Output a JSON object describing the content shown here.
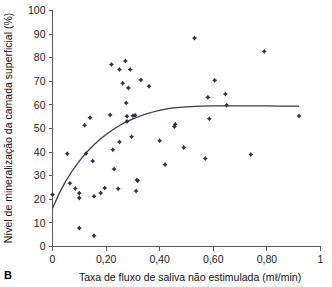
{
  "panel": {
    "label": "B"
  },
  "chart_data": {
    "type": "scatter",
    "title": "",
    "xlabel": "Taxa de fluxo de saliva não estimulada (mℓ/min)",
    "ylabel": "Nível de mineralização da camada superficial (%)",
    "xlim": [
      0,
      1
    ],
    "ylim": [
      0,
      100
    ],
    "grid": false,
    "legend": "none",
    "marker_color": "#2e2e5c",
    "curve_color": "#3c3c3c",
    "axis_color": "#5a5a5a",
    "xticks": [
      0,
      0.2,
      0.4,
      0.6,
      0.8,
      1
    ],
    "xtick_labels": [
      "0",
      "0,20",
      "0,40",
      "0,60",
      "0,80",
      "1"
    ],
    "yticks": [
      0,
      10,
      20,
      30,
      40,
      50,
      60,
      70,
      80,
      90,
      100
    ],
    "ytick_labels": [
      "0",
      "10",
      "20",
      "30",
      "40",
      "50",
      "60",
      "70",
      "80",
      "90",
      "100"
    ],
    "series": [
      {
        "name": "Amostras",
        "type": "scatter",
        "points": [
          [
            0.0,
            22.0
          ],
          [
            0.055,
            39.3
          ],
          [
            0.065,
            26.8
          ],
          [
            0.085,
            24.6
          ],
          [
            0.1,
            22.6
          ],
          [
            0.1,
            20.6
          ],
          [
            0.1,
            7.8
          ],
          [
            0.125,
            39.4
          ],
          [
            0.12,
            51.4
          ],
          [
            0.14,
            54.6
          ],
          [
            0.15,
            36.2
          ],
          [
            0.155,
            21.3
          ],
          [
            0.155,
            4.6
          ],
          [
            0.18,
            22.7
          ],
          [
            0.195,
            24.8
          ],
          [
            0.215,
            55.7
          ],
          [
            0.22,
            77.1
          ],
          [
            0.225,
            41.0
          ],
          [
            0.23,
            32.8
          ],
          [
            0.245,
            24.5
          ],
          [
            0.25,
            75.0
          ],
          [
            0.25,
            44.3
          ],
          [
            0.262,
            69.2
          ],
          [
            0.272,
            78.6
          ],
          [
            0.275,
            60.8
          ],
          [
            0.278,
            55.2
          ],
          [
            0.278,
            53.0
          ],
          [
            0.283,
            67.2
          ],
          [
            0.29,
            75.0
          ],
          [
            0.295,
            46.5
          ],
          [
            0.3,
            55.4
          ],
          [
            0.308,
            55.6
          ],
          [
            0.312,
            23.5
          ],
          [
            0.315,
            28.2
          ],
          [
            0.318,
            27.9
          ],
          [
            0.33,
            70.6
          ],
          [
            0.36,
            67.9
          ],
          [
            0.4,
            44.8
          ],
          [
            0.42,
            34.7
          ],
          [
            0.455,
            50.8
          ],
          [
            0.458,
            51.8
          ],
          [
            0.49,
            41.9
          ],
          [
            0.53,
            88.3
          ],
          [
            0.57,
            37.3
          ],
          [
            0.58,
            63.2
          ],
          [
            0.585,
            54.1
          ],
          [
            0.605,
            70.4
          ],
          [
            0.645,
            64.6
          ],
          [
            0.65,
            59.9
          ],
          [
            0.74,
            39.0
          ],
          [
            0.79,
            82.6
          ],
          [
            0.92,
            55.3
          ]
        ]
      },
      {
        "name": "Curva ajustada",
        "type": "line",
        "points": [
          [
            0.0,
            16.2
          ],
          [
            0.025,
            22.5
          ],
          [
            0.05,
            27.8
          ],
          [
            0.075,
            32.3
          ],
          [
            0.1,
            36.2
          ],
          [
            0.125,
            39.6
          ],
          [
            0.15,
            42.6
          ],
          [
            0.175,
            45.2
          ],
          [
            0.2,
            47.5
          ],
          [
            0.225,
            49.5
          ],
          [
            0.25,
            51.3
          ],
          [
            0.275,
            52.8
          ],
          [
            0.3,
            54.1
          ],
          [
            0.325,
            55.2
          ],
          [
            0.35,
            56.2
          ],
          [
            0.375,
            57.0
          ],
          [
            0.4,
            57.7
          ],
          [
            0.425,
            58.3
          ],
          [
            0.45,
            58.7
          ],
          [
            0.475,
            59.0
          ],
          [
            0.5,
            59.2
          ],
          [
            0.55,
            59.5
          ],
          [
            0.6,
            59.6
          ],
          [
            0.65,
            59.6
          ],
          [
            0.7,
            59.6
          ],
          [
            0.75,
            59.6
          ],
          [
            0.8,
            59.6
          ],
          [
            0.85,
            59.5
          ],
          [
            0.92,
            59.5
          ]
        ]
      }
    ]
  }
}
